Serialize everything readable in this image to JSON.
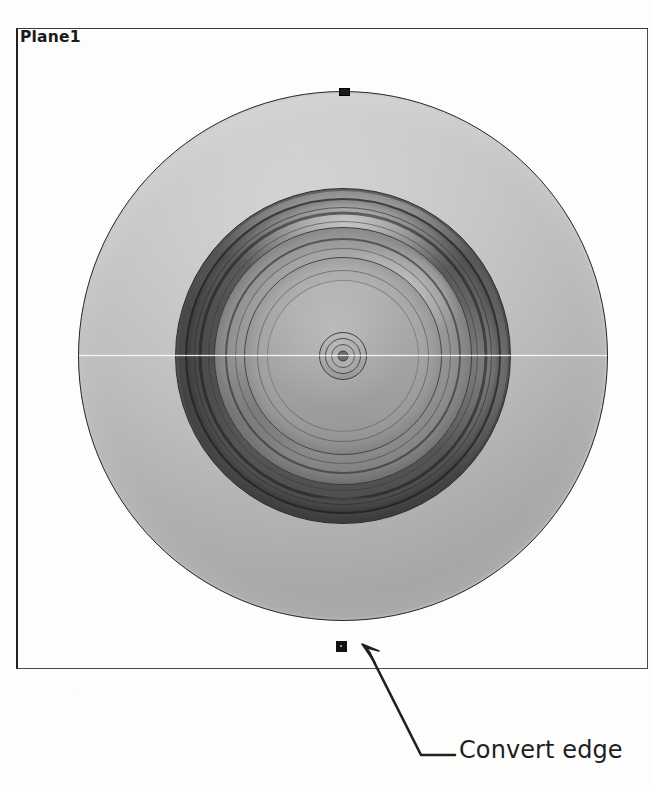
{
  "viewport": {
    "plane_label": "Plane1",
    "frame": {
      "x": 16,
      "y": 28,
      "width": 632,
      "height": 641
    }
  },
  "model": {
    "name": "wheel-and-tire-assembly",
    "view": "front",
    "center": {
      "x": 343,
      "y": 356
    },
    "features": [
      {
        "name": "converted-plane-circle",
        "radius": 264,
        "fill": "#c3c3c3",
        "edge": "#262626"
      },
      {
        "name": "tire-sidewall",
        "radius": 167,
        "fill": "#585858"
      },
      {
        "name": "rim-barrel",
        "radius": 128,
        "fill": "#969696"
      },
      {
        "name": "wheel-dish",
        "radius": 98,
        "fill": "#a8a8a8"
      },
      {
        "name": "hub",
        "radius": 23,
        "fill": "#aaaaaa"
      }
    ],
    "axis_line": {
      "name": "horizontal-construction-line",
      "y": 355,
      "color": "#ffffff"
    }
  },
  "sketch_points": [
    {
      "name": "sketch-point-top",
      "x": 343,
      "y": 91
    },
    {
      "name": "sketch-point-bottom",
      "x": 341,
      "y": 646,
      "selected": true
    }
  ],
  "callout": {
    "label": "Convert edge",
    "leader": {
      "arrow_tip": {
        "x": 363,
        "y": 647
      },
      "elbow": {
        "x": 421,
        "y": 755
      },
      "shoulder_end": {
        "x": 455,
        "y": 755
      }
    },
    "color": "#1f1f1f"
  }
}
